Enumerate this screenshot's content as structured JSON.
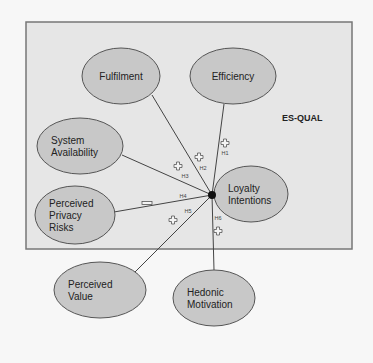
{
  "diagram": {
    "box": {
      "label": "ES-QUAL",
      "x": 26,
      "y": 22,
      "width": 326,
      "height": 227,
      "fill": "#e6e6e6",
      "stroke": "#777777"
    },
    "hub": {
      "x": 212,
      "y": 195
    },
    "colors": {
      "node_fill": "#c8c8c8",
      "node_stroke": "#555555",
      "line": "#444444",
      "background": "#f7f7f7"
    },
    "nodes": [
      {
        "id": "fulfilment",
        "lines": [
          "Fulfilment"
        ],
        "cx": 121,
        "cy": 76,
        "rx": 39,
        "ry": 28
      },
      {
        "id": "efficiency",
        "lines": [
          "Efficiency"
        ],
        "cx": 233,
        "cy": 76,
        "rx": 43,
        "ry": 28
      },
      {
        "id": "system-availability",
        "lines": [
          "System",
          "Availability"
        ],
        "cx": 80,
        "cy": 146,
        "rx": 43,
        "ry": 28
      },
      {
        "id": "perceived-privacy-risks",
        "lines": [
          "Perceived",
          "Privacy",
          "Risks"
        ],
        "cx": 75,
        "cy": 215,
        "rx": 40,
        "ry": 29
      },
      {
        "id": "loyalty-intentions",
        "lines": [
          "Loyalty",
          "Intentions"
        ],
        "cx": 251,
        "cy": 194,
        "rx": 37,
        "ry": 28
      },
      {
        "id": "perceived-value",
        "lines": [
          "Perceived",
          "Value"
        ],
        "cx": 100,
        "cy": 290,
        "rx": 46,
        "ry": 28
      },
      {
        "id": "hedonic-motivation",
        "lines": [
          "Hedonic",
          "Motivation"
        ],
        "cx": 214,
        "cy": 298,
        "rx": 41,
        "ry": 28
      }
    ],
    "edges": [
      {
        "hypothesis": "H1",
        "from": "efficiency",
        "x1": 224,
        "y1": 104,
        "sign": "+",
        "label_x": 225,
        "label_y": 155,
        "sign_x": 225,
        "sign_y": 143
      },
      {
        "hypothesis": "H2",
        "from": "fulfilment",
        "x1": 152,
        "y1": 95,
        "sign": "+",
        "label_x": 203,
        "label_y": 170,
        "sign_x": 199,
        "sign_y": 157
      },
      {
        "hypothesis": "H3",
        "from": "system-availability",
        "x1": 122,
        "y1": 155,
        "sign": "+",
        "label_x": 185,
        "label_y": 178,
        "sign_x": 178,
        "sign_y": 166
      },
      {
        "hypothesis": "H4",
        "from": "perceived-privacy-risks",
        "x1": 114,
        "y1": 212,
        "sign": "−",
        "label_x": 183,
        "label_y": 198,
        "sign_x": 147,
        "sign_y": 203
      },
      {
        "hypothesis": "H5",
        "from": "perceived-value",
        "x1": 135,
        "y1": 272,
        "sign": "+",
        "label_x": 188,
        "label_y": 213,
        "sign_x": 173,
        "sign_y": 220
      },
      {
        "hypothesis": "H6",
        "from": "hedonic-motivation",
        "x1": 214,
        "y1": 270,
        "sign": "+",
        "label_x": 218,
        "label_y": 220,
        "sign_x": 218,
        "sign_y": 231
      }
    ]
  }
}
